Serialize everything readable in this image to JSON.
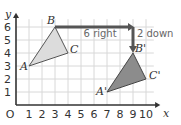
{
  "diagram": {
    "axes": {
      "x_label": "x",
      "y_label": "y",
      "origin_label": "O",
      "x_ticks": [
        "1",
        "2",
        "3",
        "4",
        "5",
        "6",
        "7",
        "8",
        "9",
        "10"
      ],
      "y_ticks": [
        "1",
        "2",
        "3",
        "4",
        "5",
        "6"
      ]
    },
    "original_triangle": {
      "vertices": [
        {
          "name": "A",
          "x": 1,
          "y": 3
        },
        {
          "name": "B",
          "x": 3,
          "y": 6
        },
        {
          "name": "C",
          "x": 4,
          "y": 4
        }
      ],
      "fill": "#dcdcdc"
    },
    "image_triangle": {
      "vertices": [
        {
          "name": "A'",
          "x": 7,
          "y": 1
        },
        {
          "name": "B'",
          "x": 9,
          "y": 4
        },
        {
          "name": "C'",
          "x": 10,
          "y": 2
        }
      ],
      "fill": "#8c8c8c"
    },
    "translation": {
      "horizontal_label": "6 right",
      "vertical_label": "2 down",
      "arrow_color": "#555555"
    },
    "grid_color": "#d8d8d8"
  }
}
